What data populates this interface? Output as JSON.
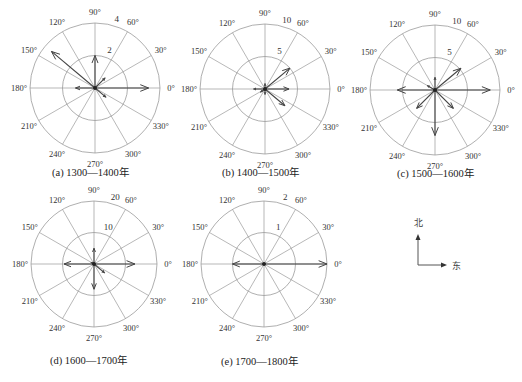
{
  "chart_data": [
    {
      "type": "polar-vector",
      "id": "a",
      "title": "(a) 1300—1400年",
      "center": [
        95,
        88
      ],
      "outer_radius": 65,
      "rings": [
        2,
        4
      ],
      "ring_labels": [
        "2",
        "4"
      ],
      "angle_ticks": [
        0,
        30,
        60,
        90,
        120,
        150,
        180,
        210,
        240,
        270,
        300,
        330
      ],
      "vectors": [
        {
          "angle": 0,
          "value": 3.3
        },
        {
          "angle": 90,
          "value": 2.0
        },
        {
          "angle": 140,
          "value": 3.5
        },
        {
          "angle": 45,
          "value": 0.9
        },
        {
          "angle": 180,
          "value": 1.2
        },
        {
          "angle": 320,
          "value": 0.9
        }
      ]
    },
    {
      "type": "polar-vector",
      "id": "b",
      "title": "(b) 1400—1500年",
      "center": [
        265,
        89
      ],
      "outer_radius": 65,
      "rings": [
        5,
        10
      ],
      "ring_labels": [
        "5",
        "10"
      ],
      "angle_ticks": [
        0,
        30,
        60,
        90,
        120,
        150,
        180,
        210,
        240,
        270,
        300,
        330
      ],
      "vectors": [
        {
          "angle": 40,
          "value": 5.0
        },
        {
          "angle": 0,
          "value": 3.7
        },
        {
          "angle": 320,
          "value": 4.0
        },
        {
          "angle": 180,
          "value": 1.8
        },
        {
          "angle": 90,
          "value": 0.9
        },
        {
          "angle": 270,
          "value": 0.9
        },
        {
          "angle": 215,
          "value": 0.9
        }
      ]
    },
    {
      "type": "polar-vector",
      "id": "c",
      "title": "(c) 1500—1600年",
      "center": [
        435,
        90
      ],
      "outer_radius": 65,
      "rings": [
        5,
        10
      ],
      "ring_labels": [
        "5",
        "10"
      ],
      "angle_ticks": [
        0,
        30,
        60,
        90,
        120,
        150,
        180,
        210,
        240,
        270,
        300,
        330
      ],
      "vectors": [
        {
          "angle": 0,
          "value": 8.5
        },
        {
          "angle": 40,
          "value": 5.2
        },
        {
          "angle": 90,
          "value": 2.0
        },
        {
          "angle": 150,
          "value": 1.4
        },
        {
          "angle": 180,
          "value": 5.8
        },
        {
          "angle": 225,
          "value": 4.0
        },
        {
          "angle": 270,
          "value": 7.0
        },
        {
          "angle": 315,
          "value": 4.0
        }
      ]
    },
    {
      "type": "polar-vector",
      "id": "d",
      "title": "(d) 1600—1700年",
      "center": [
        94,
        264
      ],
      "outer_radius": 63,
      "rings": [
        10,
        20
      ],
      "ring_labels": [
        "10",
        "20"
      ],
      "angle_ticks": [
        0,
        30,
        60,
        90,
        120,
        150,
        180,
        210,
        240,
        270,
        300,
        330
      ],
      "vectors": [
        {
          "angle": 0,
          "value": 13.0
        },
        {
          "angle": 180,
          "value": 9.5
        },
        {
          "angle": 90,
          "value": 5.0
        },
        {
          "angle": 270,
          "value": 8.0
        },
        {
          "angle": 320,
          "value": 4.5
        },
        {
          "angle": 150,
          "value": 1.2
        }
      ]
    },
    {
      "type": "polar-vector",
      "id": "e",
      "title": "(e) 1700—1800年",
      "center": [
        264,
        264
      ],
      "outer_radius": 63,
      "rings": [
        1,
        2
      ],
      "ring_labels": [
        "1",
        "2"
      ],
      "angle_ticks": [
        0,
        30,
        60,
        90,
        120,
        150,
        180,
        210,
        240,
        270,
        300,
        330
      ],
      "vectors": [
        {
          "angle": 0,
          "value": 2.0
        },
        {
          "angle": 180,
          "value": 1.0
        }
      ]
    }
  ],
  "captions": {
    "a": "(a) 1300—1400年",
    "b": "(b) 1400—1500年",
    "c": "(c) 1500—1600年",
    "d": "(d) 1600—1700年",
    "e": "(e) 1700—1800年"
  },
  "compass": {
    "north_label": "北",
    "east_label": "东"
  },
  "colors": {
    "grid": "#9a9a9a",
    "arrow": "#444444",
    "text": "#222222"
  }
}
